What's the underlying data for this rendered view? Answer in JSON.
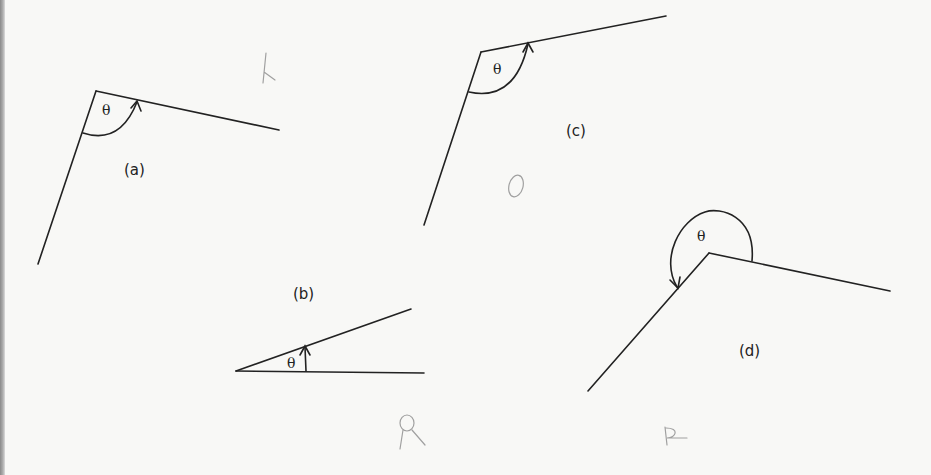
{
  "figure": {
    "angles": [
      {
        "id": "a",
        "label": "(a)",
        "symbol": "θ",
        "type": "obtuse"
      },
      {
        "id": "b",
        "label": "(b)",
        "symbol": "θ",
        "type": "acute"
      },
      {
        "id": "c",
        "label": "(c)",
        "symbol": "θ",
        "type": "obtuse"
      },
      {
        "id": "d",
        "label": "(d)",
        "symbol": "θ",
        "type": "reflex"
      }
    ],
    "annotations": {
      "pencil_mark_a": "R",
      "pencil_mark_c": "O",
      "pencil_mark_b": "Q",
      "pencil_mark_d": "R"
    },
    "colors": {
      "ink": "#222222",
      "pencil": "#9a9a9a",
      "paper": "#f8f8f6"
    }
  }
}
